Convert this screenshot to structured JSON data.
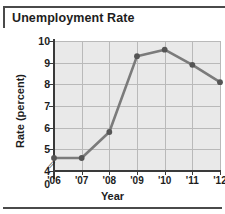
{
  "figure": {
    "title": "Unemployment Rate"
  },
  "chart_data": {
    "type": "line",
    "title": "Unemployment Rate",
    "xlabel": "Year",
    "ylabel": "Rate (percent)",
    "categories": [
      "'06",
      "'07",
      "'08",
      "'09",
      "'10",
      "'11",
      "'12"
    ],
    "values": [
      4.6,
      4.6,
      5.8,
      9.3,
      9.6,
      8.9,
      8.1
    ],
    "series": [
      {
        "name": "Unemployment Rate",
        "values": [
          4.6,
          4.6,
          5.8,
          9.3,
          9.6,
          8.9,
          8.1
        ]
      }
    ],
    "ylim": [
      4,
      10
    ],
    "y_ticks": [
      "0",
      "4",
      "5",
      "6",
      "7",
      "8",
      "9",
      "10"
    ],
    "y_tick_values": [
      0,
      4,
      5,
      6,
      7,
      8,
      9,
      10
    ],
    "x_ticks": [
      "'06",
      "'07",
      "'08",
      "'09",
      "'10",
      "'11",
      "'12"
    ],
    "axis_break": true,
    "axis_break_symbol": "//",
    "grid": true,
    "legend": "none",
    "line_color": "#7b7b7b",
    "marker_color": "#555555",
    "plot_background": "#e9e9e9",
    "grid_color": "#b9b9b9"
  }
}
